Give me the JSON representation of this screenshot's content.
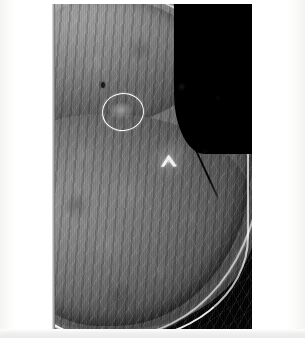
{
  "document": {
    "background_color": "#ffffff",
    "footer_band_color": "#e9e9e7"
  },
  "image": {
    "modality": "mammography",
    "description": "Mammogram radiograph, breast tissue at left with black air background at upper right",
    "frame": {
      "left": 52,
      "top": 4,
      "width": 200,
      "height": 325,
      "background_color": "#000000"
    },
    "tissue": {
      "parenchyma_color": "#8a8a8a",
      "fat_color": "#4a4a4a",
      "skin_line_color": "#ffffff",
      "air_color": "#000000",
      "density_description": "heterogeneously dense fibroglandular tissue"
    }
  },
  "annotations": [
    {
      "name": "lesion-circle",
      "type": "circle-overlay",
      "color": "#ffffff",
      "center_x": 122,
      "center_y": 111,
      "radius_x": 20,
      "radius_y": 18,
      "description": "white circle outlining a focal asymmetry in the upper breast"
    },
    {
      "name": "lesion-mass",
      "type": "soft-tissue-density",
      "center_x": 122,
      "center_y": 111,
      "description": "subtle ill-defined density within the circled region"
    },
    {
      "name": "punctate-focus",
      "type": "punctate-opacity",
      "center_x": 103,
      "center_y": 85,
      "description": "small dark punctate focus superior-lateral to the circle"
    },
    {
      "name": "marker-clip",
      "type": "metallic-marker",
      "color": "#ffffff",
      "center_x": 169,
      "center_y": 160,
      "description": "bright chevron-shaped biopsy marker clip"
    },
    {
      "name": "linear-structure",
      "type": "linear-density",
      "color": "#000000",
      "start_x": 192,
      "start_y": 144,
      "end_x": 218,
      "end_y": 200,
      "description": "thin dark linear structure near the anterior skin surface"
    }
  ]
}
